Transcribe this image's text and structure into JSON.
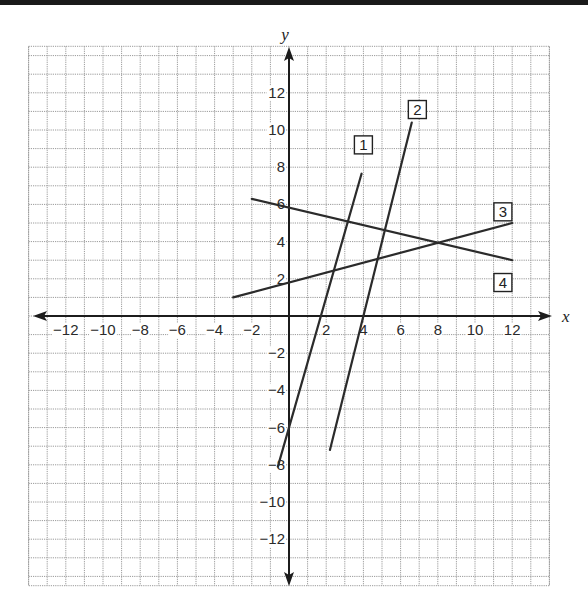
{
  "chart_data": {
    "type": "line",
    "title": "",
    "xlabel": "x",
    "ylabel": "y",
    "xlim": [
      -14,
      14
    ],
    "ylim": [
      -14.5,
      14.5
    ],
    "grid": true,
    "grid_step": 1,
    "x_ticks": [
      -12,
      -10,
      -8,
      -6,
      -4,
      -2,
      2,
      4,
      6,
      8,
      10,
      12
    ],
    "y_ticks": [
      -12,
      -10,
      -8,
      -6,
      -4,
      -2,
      2,
      4,
      6,
      8,
      10,
      12
    ],
    "x_tick_labels": [
      "−12",
      "−10",
      "−8",
      "−6",
      "−4",
      "−2",
      "2",
      "4",
      "6",
      "8",
      "10",
      "12"
    ],
    "y_tick_labels": [
      "−12",
      "−10",
      "−8",
      "−6",
      "−4",
      "−2",
      "2",
      "4",
      "6",
      "8",
      "10",
      "12"
    ],
    "series": [
      {
        "name": "1",
        "equation": "y = 3.5x - 6",
        "points": [
          [
            -0.6,
            -8.1
          ],
          [
            3.9,
            7.65
          ]
        ],
        "label_pos": [
          4.0,
          9.2
        ]
      },
      {
        "name": "2",
        "equation": "y = 4x - 16",
        "points": [
          [
            2.2,
            -7.2
          ],
          [
            6.6,
            10.4
          ]
        ],
        "label_pos": [
          6.9,
          11.1
        ]
      },
      {
        "name": "3",
        "equation": "y = 0.27x + 1.8",
        "points": [
          [
            -3,
            1.0
          ],
          [
            12,
            5.0
          ]
        ],
        "label_pos": [
          11.5,
          5.6
        ]
      },
      {
        "name": "4",
        "equation": "y = -0.24x + 5.83",
        "points": [
          [
            -2,
            6.3
          ],
          [
            12,
            3.0
          ]
        ],
        "label_pos": [
          11.5,
          1.8
        ]
      }
    ],
    "intersections": [
      {
        "lines": [
          "1",
          "3"
        ],
        "point": [
          2.5,
          2.5
        ]
      },
      {
        "lines": [
          "1",
          "4"
        ],
        "point": [
          3.1,
          5.1
        ]
      },
      {
        "lines": [
          "2",
          "3"
        ],
        "point": [
          4.8,
          3.1
        ]
      },
      {
        "lines": [
          "2",
          "4"
        ],
        "point": [
          5.3,
          4.6
        ]
      },
      {
        "lines": [
          "3",
          "4"
        ],
        "point": [
          8.0,
          3.9
        ]
      }
    ]
  },
  "style": {
    "line_color": "#2b2b2b",
    "axis_color": "#1c1c1c",
    "grid_color": "#9a9a9a",
    "background": "#ffffff"
  }
}
